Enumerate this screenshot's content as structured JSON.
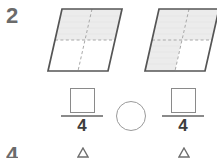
{
  "worksheet": {
    "question_number": "2",
    "next_question_number_partial": "4",
    "figures": [
      {
        "name": "left-parallelogram",
        "shape": "parallelogram",
        "total_parts": 4,
        "shaded_parts": 2,
        "shaded_cells": [
          "top-left",
          "top-right"
        ],
        "outline_color": "#555555",
        "divider_style": "dashed",
        "divider_color": "#9a9a9a",
        "shade_color": "#ececec",
        "cropped": false
      },
      {
        "name": "right-parallelogram",
        "shape": "parallelogram",
        "total_parts": 4,
        "shaded_parts": 3,
        "shaded_cells": [
          "top-left",
          "top-right",
          "bottom-left"
        ],
        "outline_color": "#555555",
        "divider_style": "dashed",
        "divider_color": "#9a9a9a",
        "shade_color": "#ececec",
        "cropped": true
      }
    ],
    "answers": [
      {
        "name": "left-fraction",
        "numerator": "",
        "numerator_placeholder": "",
        "denominator": "4"
      },
      {
        "name": "right-fraction",
        "numerator": "",
        "numerator_placeholder": "",
        "denominator": "4"
      }
    ],
    "comparison": {
      "name": "comparison-circle",
      "value": "",
      "shape": "circle"
    }
  }
}
